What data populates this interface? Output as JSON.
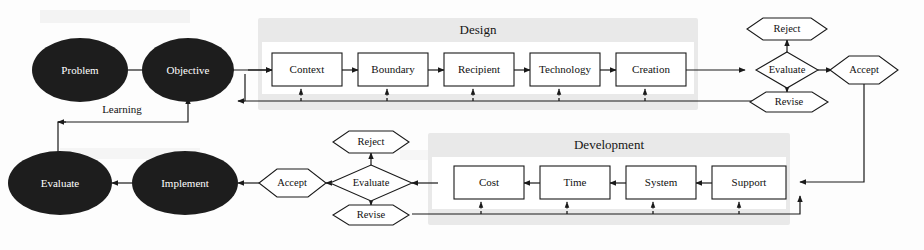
{
  "diagram": {
    "colors": {
      "ellipse_fill": "#1d1d1d",
      "ellipse_text": "#ffffff",
      "panel_fill": "#e9e9e9",
      "line": "#1a1a1a",
      "box_fill": "#ffffff",
      "page_background": "#fdfdfd"
    },
    "panels": [
      {
        "id": "design",
        "label": "Design"
      },
      {
        "id": "development",
        "label": "Development"
      }
    ],
    "ellipses": [
      {
        "id": "problem",
        "label": "Problem"
      },
      {
        "id": "objective",
        "label": "Objective"
      },
      {
        "id": "evaluate_bottom",
        "label": "Evaluate"
      },
      {
        "id": "implement",
        "label": "Implement"
      }
    ],
    "design_boxes": [
      {
        "id": "context",
        "label": "Context"
      },
      {
        "id": "boundary",
        "label": "Boundary"
      },
      {
        "id": "recipient",
        "label": "Recipient"
      },
      {
        "id": "technology",
        "label": "Technology"
      },
      {
        "id": "creation",
        "label": "Creation"
      }
    ],
    "development_boxes": [
      {
        "id": "support",
        "label": "Support"
      },
      {
        "id": "system",
        "label": "System"
      },
      {
        "id": "time",
        "label": "Time"
      },
      {
        "id": "cost",
        "label": "Cost"
      }
    ],
    "decisions": [
      {
        "id": "evaluate_design",
        "label": "Evaluate"
      },
      {
        "id": "evaluate_development",
        "label": "Evaluate"
      }
    ],
    "outcomes": [
      {
        "id": "reject_design",
        "label": "Reject"
      },
      {
        "id": "revise_design",
        "label": "Revise"
      },
      {
        "id": "accept_design",
        "label": "Accept"
      },
      {
        "id": "reject_development",
        "label": "Reject"
      },
      {
        "id": "revise_development",
        "label": "Revise"
      },
      {
        "id": "accept_development",
        "label": "Accept"
      }
    ],
    "edge_labels": [
      {
        "id": "learning",
        "label": "Learning"
      }
    ]
  }
}
